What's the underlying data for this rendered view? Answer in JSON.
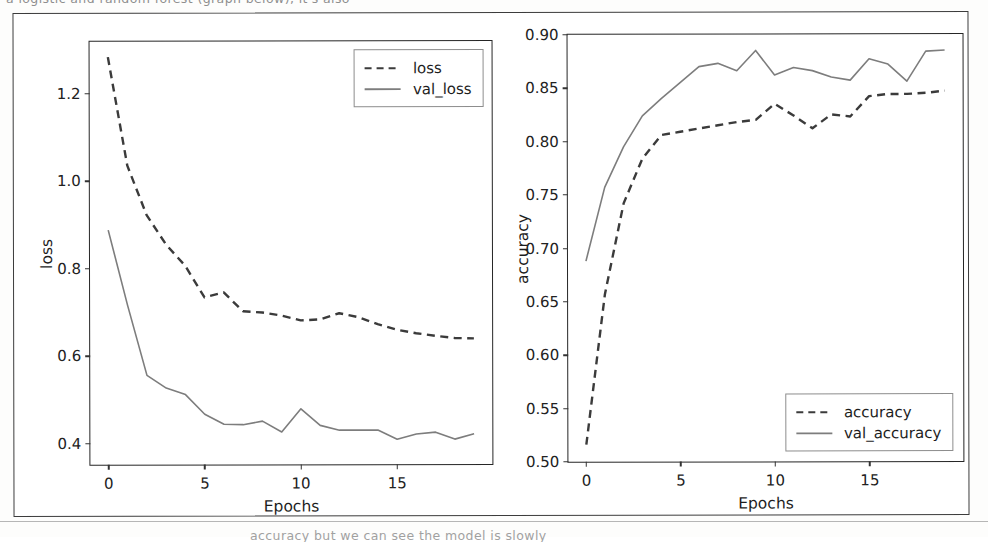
{
  "page": {
    "scan_text_top": "a logistic and random forest (graph below), it's also",
    "scan_text_bottom": "accuracy but we can see the model is slowly"
  },
  "figure": {
    "subplots": [
      "loss",
      "accuracy"
    ]
  },
  "chart_data": [
    {
      "type": "line",
      "id": "loss",
      "title": "",
      "xlabel": "Epochs",
      "ylabel": "loss",
      "xlim": [
        -0.95,
        19.95
      ],
      "ylim": [
        0.352,
        1.318
      ],
      "xticks": [
        0,
        5,
        10,
        15
      ],
      "yticks": [
        0.4,
        0.6,
        0.8,
        1.0,
        1.2
      ],
      "ytick_labels": [
        "0.4",
        "0.6",
        "0.8",
        "1.0",
        "1.2"
      ],
      "xtick_labels": [
        "0",
        "5",
        "10",
        "15"
      ],
      "grid": false,
      "legend_position": "upper right",
      "x": [
        0,
        1,
        2,
        3,
        4,
        5,
        6,
        7,
        8,
        9,
        10,
        11,
        12,
        13,
        14,
        15,
        16,
        17,
        18,
        19
      ],
      "series": [
        {
          "name": "loss",
          "style": "dashed",
          "color": "#3b3b3b",
          "values": [
            1.283,
            1.035,
            0.922,
            0.855,
            0.806,
            0.734,
            0.745,
            0.702,
            0.699,
            0.692,
            0.681,
            0.683,
            0.697,
            0.688,
            0.672,
            0.659,
            0.651,
            0.645,
            0.64,
            0.639
          ]
        },
        {
          "name": "val_loss",
          "style": "solid",
          "color": "#7d7d7d",
          "values": [
            0.888,
            0.716,
            0.556,
            0.527,
            0.512,
            0.467,
            0.444,
            0.443,
            0.451,
            0.426,
            0.479,
            0.441,
            0.43,
            0.43,
            0.43,
            0.409,
            0.421,
            0.425,
            0.409,
            0.421
          ]
        }
      ]
    },
    {
      "type": "line",
      "id": "accuracy",
      "title": "",
      "xlabel": "Epochs",
      "ylabel": "accuracy",
      "xlim": [
        -0.95,
        19.95
      ],
      "ylim": [
        0.5,
        0.9
      ],
      "xticks": [
        0,
        5,
        10,
        15
      ],
      "yticks": [
        0.5,
        0.55,
        0.6,
        0.65,
        0.7,
        0.75,
        0.8,
        0.85,
        0.9
      ],
      "ytick_labels": [
        "0.50",
        "0.55",
        "0.60",
        "0.65",
        "0.70",
        "0.75",
        "0.80",
        "0.85",
        "0.90"
      ],
      "xtick_labels": [
        "0",
        "5",
        "10",
        "15"
      ],
      "grid": false,
      "legend_position": "lower right",
      "x": [
        0,
        1,
        2,
        3,
        4,
        5,
        6,
        7,
        8,
        9,
        10,
        11,
        12,
        13,
        14,
        15,
        16,
        17,
        18,
        19
      ],
      "series": [
        {
          "name": "accuracy",
          "style": "dashed",
          "color": "#3b3b3b",
          "values": [
            0.516,
            0.657,
            0.742,
            0.784,
            0.806,
            0.809,
            0.812,
            0.815,
            0.818,
            0.82,
            0.835,
            0.824,
            0.812,
            0.825,
            0.823,
            0.842,
            0.844,
            0.844,
            0.845,
            0.847
          ]
        },
        {
          "name": "val_accuracy",
          "style": "solid",
          "color": "#7d7d7d",
          "values": [
            0.688,
            0.757,
            0.795,
            0.824,
            0.84,
            0.855,
            0.87,
            0.873,
            0.866,
            0.885,
            0.862,
            0.869,
            0.866,
            0.86,
            0.857,
            0.877,
            0.872,
            0.856,
            0.884,
            0.885
          ]
        }
      ]
    }
  ]
}
